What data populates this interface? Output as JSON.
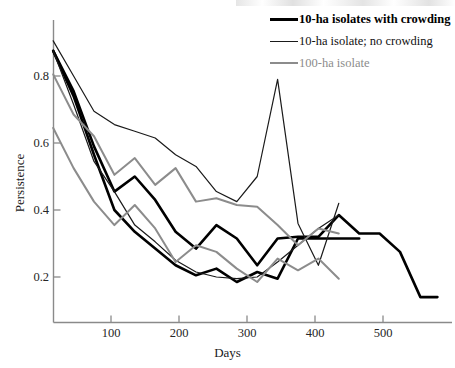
{
  "chart_data": {
    "type": "line",
    "title": "",
    "xlabel": "Days",
    "ylabel": "Persistence",
    "xlim": [
      0,
      600
    ],
    "ylim": [
      0.0,
      0.95
    ],
    "grid": false,
    "legend_position": "top-right",
    "xticks": [
      100,
      200,
      300,
      400,
      500
    ],
    "yticks": [
      0.2,
      0.4,
      0.6,
      0.8
    ],
    "xtick_labels": [
      "100",
      "200",
      "300",
      "400",
      "500"
    ],
    "ytick_labels": [
      "0.2",
      "0.4",
      "0.6",
      "0.8"
    ],
    "legend": [
      {
        "label": "10-ha isolates with crowding",
        "color": "#000000",
        "width": 3.0
      },
      {
        "label": "10-ha isolate; no crowding",
        "color": "#1a1a1a",
        "width": 1.2
      },
      {
        "label": "100-ha isolate",
        "color": "#8c8c8c",
        "width": 2.0
      }
    ],
    "series": [
      {
        "name": "10-ha isolates with crowding (A)",
        "group": "10-ha isolates with crowding",
        "color": "#000000",
        "width": 2.6,
        "x": [
          15,
          45,
          75,
          105,
          135,
          165,
          195,
          225,
          255,
          285,
          315,
          345,
          375,
          405,
          435,
          465,
          495,
          525,
          555,
          580
        ],
        "y": [
          0.875,
          0.755,
          0.59,
          0.455,
          0.5,
          0.43,
          0.335,
          0.285,
          0.355,
          0.315,
          0.235,
          0.315,
          0.32,
          0.32,
          0.385,
          0.33,
          0.33,
          0.275,
          0.14,
          0.14
        ]
      },
      {
        "name": "10-ha isolates with crowding (B)",
        "group": "10-ha isolates with crowding",
        "color": "#000000",
        "width": 2.6,
        "x": [
          15,
          45,
          75,
          105,
          135,
          165,
          195,
          225,
          255,
          285,
          315,
          345,
          375,
          405,
          435,
          465
        ],
        "y": [
          0.875,
          0.74,
          0.565,
          0.4,
          0.335,
          0.285,
          0.235,
          0.205,
          0.225,
          0.185,
          0.215,
          0.195,
          0.315,
          0.315,
          0.315,
          0.315
        ]
      },
      {
        "name": "10-ha isolate; no crowding (A)",
        "group": "10-ha isolate; no crowding",
        "color": "#1a1a1a",
        "width": 1.2,
        "x": [
          15,
          45,
          75,
          105,
          135,
          165,
          195,
          225,
          255,
          285,
          315,
          345,
          375,
          405,
          435
        ],
        "y": [
          0.905,
          0.8,
          0.695,
          0.655,
          0.635,
          0.615,
          0.565,
          0.53,
          0.455,
          0.425,
          0.5,
          0.79,
          0.36,
          0.235,
          0.42
        ]
      },
      {
        "name": "10-ha isolate; no crowding (B)",
        "group": "10-ha isolate; no crowding",
        "color": "#1a1a1a",
        "width": 1.2,
        "x": [
          15,
          45,
          75,
          105,
          135,
          165,
          195,
          225,
          255,
          285,
          315,
          345,
          375,
          405,
          435
        ],
        "y": [
          0.875,
          0.715,
          0.545,
          0.455,
          0.355,
          0.305,
          0.25,
          0.215,
          0.2,
          0.195,
          0.2,
          0.245,
          0.295,
          0.345,
          0.385
        ]
      },
      {
        "name": "100-ha isolate (A)",
        "group": "100-ha isolate",
        "color": "#8c8c8c",
        "width": 2.0,
        "x": [
          15,
          45,
          75,
          105,
          135,
          165,
          195,
          225,
          255,
          285,
          315,
          345,
          375,
          405,
          435
        ],
        "y": [
          0.805,
          0.685,
          0.62,
          0.505,
          0.555,
          0.475,
          0.525,
          0.425,
          0.435,
          0.415,
          0.41,
          0.355,
          0.295,
          0.345,
          0.33
        ]
      },
      {
        "name": "100-ha isolate (B)",
        "group": "100-ha isolate",
        "color": "#8c8c8c",
        "width": 2.0,
        "x": [
          15,
          45,
          75,
          105,
          135,
          165,
          195,
          225,
          255,
          285,
          315,
          345,
          375,
          405,
          435
        ],
        "y": [
          0.645,
          0.525,
          0.425,
          0.355,
          0.415,
          0.345,
          0.245,
          0.295,
          0.275,
          0.225,
          0.185,
          0.255,
          0.22,
          0.255,
          0.195
        ]
      }
    ]
  },
  "axes": {
    "x_title": "Days",
    "y_title": "Persistence"
  }
}
